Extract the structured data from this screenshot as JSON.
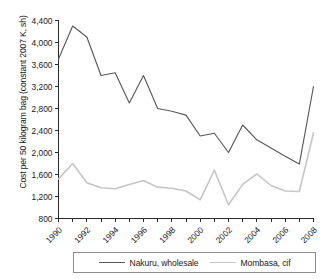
{
  "chart_data": {
    "type": "line",
    "title": "",
    "xlabel": "",
    "ylabel": "Cost per 50 kilogram bag (constant 2007 K, sh)",
    "x": [
      1990,
      1991,
      1992,
      1993,
      1994,
      1995,
      1996,
      1997,
      1998,
      1999,
      2000,
      2001,
      2002,
      2003,
      2004,
      2005,
      2006,
      2007,
      2008
    ],
    "xlim": [
      1990,
      2008
    ],
    "ylim": [
      800,
      4400
    ],
    "y_ticks": [
      800,
      1200,
      1600,
      2000,
      2400,
      2800,
      3200,
      3600,
      4000,
      4400
    ],
    "y_tick_labels": [
      "800",
      "1,200",
      "1,600",
      "2,000",
      "2,400",
      "2,800",
      "3,200",
      "3,600",
      "4,000",
      "4,400"
    ],
    "x_ticks": [
      1990,
      1991,
      1992,
      1993,
      1994,
      1995,
      1996,
      1997,
      1998,
      1999,
      2000,
      2001,
      2002,
      2003,
      2004,
      2005,
      2006,
      2007,
      2008
    ],
    "x_tick_labels": [
      "1990",
      "",
      "1992",
      "",
      "1994",
      "",
      "1996",
      "",
      "1998",
      "",
      "2000",
      "",
      "2002",
      "",
      "2004",
      "",
      "2006",
      "",
      "2008"
    ],
    "grid": false,
    "legend_position": "bottom",
    "series": [
      {
        "name": "Nakuru, wholesale",
        "color": "#5a5a5a",
        "values": [
          3700,
          4300,
          4100,
          3400,
          3450,
          2900,
          3400,
          2800,
          2750,
          2680,
          2300,
          2350,
          2000,
          2500,
          2230,
          2080,
          1930,
          1790,
          3200
        ]
      },
      {
        "name": "Mombasa, cif",
        "color": "#c6c6c6",
        "values": [
          1520,
          1800,
          1450,
          1360,
          1340,
          1420,
          1490,
          1370,
          1350,
          1300,
          1140,
          1680,
          1050,
          1420,
          1610,
          1400,
          1300,
          1290,
          2360
        ]
      }
    ]
  },
  "legend": {
    "entries": [
      {
        "label": "Nakuru, wholesale",
        "color": "#5a5a5a"
      },
      {
        "label": "Mombasa, cif",
        "color": "#c6c6c6"
      }
    ]
  }
}
